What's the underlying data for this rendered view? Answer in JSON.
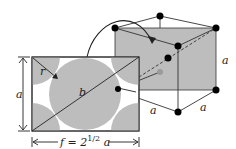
{
  "diagram": {
    "labels": {
      "radius": "r",
      "diagonal": "b",
      "side_left": "a",
      "width_prefix": "f = 2",
      "width_exponent": "1/2",
      "width_suffix": " a",
      "cube_edge_right": "a",
      "cube_edge_bottom_left": "a",
      "cube_edge_bottom_right": "a"
    },
    "colors": {
      "fill": "#bdbdbd",
      "line": "#222222",
      "atom": "#000000",
      "hidden_atom": "#9a9a9a",
      "background": "#ffffff"
    }
  }
}
